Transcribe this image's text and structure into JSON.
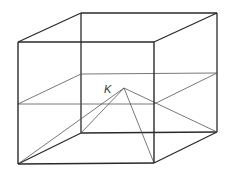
{
  "diagram": {
    "type": "cube-with-pyramid",
    "stroke_color": "#2a2a2a",
    "thin_stroke_color": "#555555",
    "labels": {
      "apex": "K"
    },
    "vertices": {
      "front_top_left": [
        18,
        42
      ],
      "front_top_right": [
        154,
        42
      ],
      "front_bottom_left": [
        18,
        164
      ],
      "front_bottom_right": [
        154,
        163
      ],
      "back_top_left": [
        81,
        13
      ],
      "back_top_right": [
        217,
        13
      ],
      "back_bottom_left": [
        81,
        133
      ],
      "back_bottom_right": [
        217,
        132
      ],
      "mid_front_left": [
        18,
        104
      ],
      "mid_front_right": [
        154,
        104
      ],
      "mid_back_left": [
        81,
        74
      ],
      "mid_back_right": [
        217,
        73
      ],
      "apex_K": [
        124,
        88
      ]
    }
  }
}
